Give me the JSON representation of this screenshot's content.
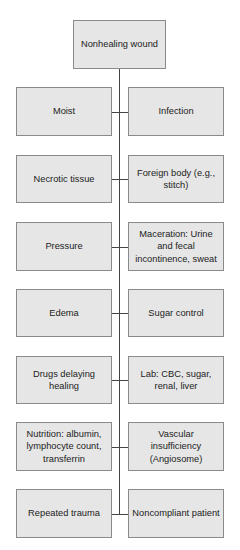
{
  "diagram": {
    "root": {
      "label": "Nonhealing wound"
    },
    "rows": [
      {
        "left": "Moist",
        "right": "Infection",
        "top": 87,
        "height": 49
      },
      {
        "left": "Necrotic tissue",
        "right": "Foreign body (e.g., stitch)",
        "top": 155,
        "height": 48
      },
      {
        "left": "Pressure",
        "right": "Maceration: Urine and fecal incontinence, sweat",
        "top": 222,
        "height": 49
      },
      {
        "left": "Edema",
        "right": "Sugar control",
        "top": 289,
        "height": 48
      },
      {
        "left": "Drugs delaying healing",
        "right": "Lab: CBC, sugar, renal, liver",
        "top": 356,
        "height": 48
      },
      {
        "left": "Nutrition: albumin, lymphocyte count, transferrin",
        "right": "Vascular insufficiency (Angiosome)",
        "top": 422,
        "height": 49
      },
      {
        "left": "Repeated trauma",
        "right": "Noncompliant patient",
        "top": 489,
        "height": 49
      }
    ]
  }
}
